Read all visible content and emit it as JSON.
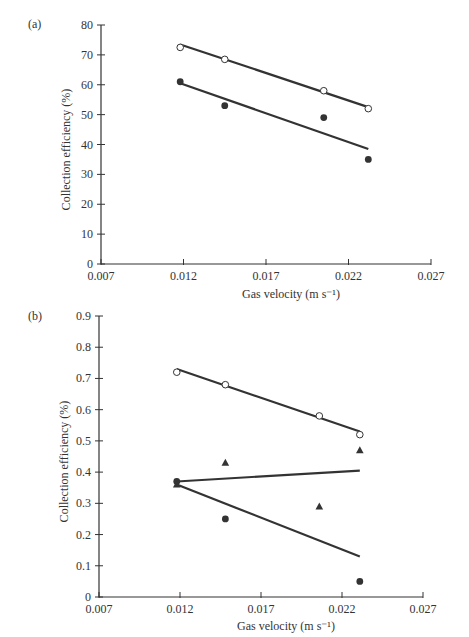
{
  "chart_data": [
    {
      "type": "scatter",
      "panel": "(a)",
      "title": "",
      "xlabel": "Gas velocity (m s⁻¹)",
      "ylabel": "Collection efficiency (%)",
      "xlim": [
        0.007,
        0.027
      ],
      "ylim": [
        0,
        80
      ],
      "xticks": [
        "0.007",
        "0.012",
        "0.017",
        "0.022",
        "0.027"
      ],
      "yticks": [
        "0",
        "10",
        "20",
        "30",
        "40",
        "50",
        "60",
        "70",
        "80"
      ],
      "grid": false,
      "legend": null,
      "series": [
        {
          "name": "open-circles",
          "marker": "open-circle",
          "x": [
            0.0118,
            0.0145,
            0.0205,
            0.0232
          ],
          "y": [
            72.5,
            68.5,
            58,
            52
          ],
          "trendline": {
            "x": [
              0.0118,
              0.0232
            ],
            "y": [
              73.5,
              52.5
            ]
          }
        },
        {
          "name": "filled-circles",
          "marker": "filled-circle",
          "x": [
            0.0118,
            0.0145,
            0.0205,
            0.0232
          ],
          "y": [
            61,
            53,
            49,
            35
          ],
          "trendline": {
            "x": [
              0.0118,
              0.0232
            ],
            "y": [
              60.5,
              38.5
            ]
          }
        }
      ]
    },
    {
      "type": "scatter",
      "panel": "(b)",
      "title": "",
      "xlabel": "Gas velocity (m s⁻¹)",
      "ylabel": "Collection efficiency (%)",
      "xlim": [
        0.007,
        0.027
      ],
      "ylim": [
        0,
        0.9
      ],
      "xticks": [
        "0.007",
        "0.012",
        "0.017",
        "0.022",
        "0.027"
      ],
      "yticks": [
        "0",
        "0.1",
        "0.2",
        "0.3",
        "0.4",
        "0.5",
        "0.6",
        "0.7",
        "0.8",
        "0.9"
      ],
      "grid": false,
      "legend": null,
      "series": [
        {
          "name": "open-circles",
          "marker": "open-circle",
          "x": [
            0.0118,
            0.0148,
            0.0206,
            0.0231
          ],
          "y": [
            0.72,
            0.68,
            0.58,
            0.52
          ],
          "trendline": {
            "x": [
              0.0118,
              0.0231
            ],
            "y": [
              0.73,
              0.53
            ]
          }
        },
        {
          "name": "filled-triangles",
          "marker": "filled-triangle",
          "x": [
            0.0118,
            0.0148,
            0.0206,
            0.0231
          ],
          "y": [
            0.36,
            0.43,
            0.29,
            0.47
          ],
          "trendline": {
            "x": [
              0.0118,
              0.0231
            ],
            "y": [
              0.37,
              0.405
            ]
          }
        },
        {
          "name": "filled-circles",
          "marker": "filled-circle",
          "x": [
            0.0118,
            0.0148,
            0.0231
          ],
          "y": [
            0.37,
            0.25,
            0.05
          ],
          "trendline": {
            "x": [
              0.0118,
              0.0231
            ],
            "y": [
              0.36,
              0.13
            ]
          }
        }
      ]
    }
  ],
  "layout": {
    "panels": [
      {
        "axis_left": 101,
        "axis_right": 431,
        "axis_top": 25,
        "axis_bottom": 264,
        "panel_label_pos": [
          28,
          28
        ],
        "ylabel_x": 70,
        "xlabel_y": 298
      },
      {
        "axis_left": 99,
        "axis_right": 423,
        "axis_top": 316,
        "axis_bottom": 597,
        "panel_label_pos": [
          28,
          320
        ],
        "ylabel_x": 68,
        "xlabel_y": 630
      }
    ],
    "ink_color": "#333333"
  }
}
